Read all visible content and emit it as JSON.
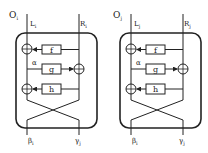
{
  "diagrams": [
    {
      "name": "feistel-block-i",
      "outer_label": "O",
      "outer_sub": "i",
      "left_in": "L",
      "left_in_sub": "i",
      "right_in": "R",
      "right_in_sub": "i",
      "functions": [
        "f",
        "g",
        "h"
      ],
      "alpha": "α",
      "left_out": "β",
      "left_out_sub": "i",
      "right_out": "γ",
      "right_out_sub": "j"
    },
    {
      "name": "feistel-block-j",
      "outer_label": "O",
      "outer_sub": "j",
      "left_in": "L",
      "left_in_sub": "j",
      "right_in": "R",
      "right_in_sub": "j",
      "functions": [
        "f",
        "g",
        "h"
      ],
      "alpha": "α",
      "left_out": "β",
      "left_out_sub": "i",
      "right_out": "γ",
      "right_out_sub": "j"
    }
  ],
  "colors": {
    "stroke": "#222222",
    "background": "#ffffff"
  }
}
